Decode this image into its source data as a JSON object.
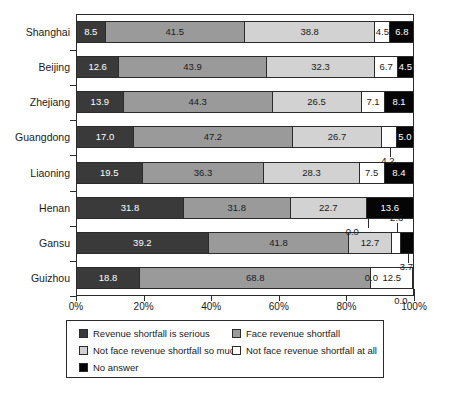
{
  "chart_data": {
    "type": "bar",
    "orientation": "horizontal",
    "stacked": true,
    "title": "",
    "subtitle": "",
    "xlabel": "",
    "ylabel": "",
    "xlim": [
      0,
      100
    ],
    "xticks": [
      "0%",
      "20%",
      "40%",
      "60%",
      "80%",
      "100%"
    ],
    "xtick_values": [
      0,
      20,
      40,
      60,
      80,
      100
    ],
    "grid": false,
    "legend_position": "bottom",
    "categories": [
      "Shanghai",
      "Beijing",
      "Zhejiang",
      "Guangdong",
      "Liaoning",
      "Henan",
      "Gansu",
      "Guizhou"
    ],
    "series": [
      {
        "name": "Revenue shortfall is serious",
        "color": "#3a3a3a",
        "values": [
          8.5,
          12.6,
          13.9,
          17.0,
          19.5,
          31.8,
          39.2,
          18.8
        ]
      },
      {
        "name": "Face revenue shortfall",
        "color": "#9a9a9a",
        "values": [
          41.5,
          43.9,
          44.3,
          47.2,
          36.3,
          31.8,
          41.8,
          68.8
        ]
      },
      {
        "name": "Not face revenue shortfall so much",
        "color": "#d2d2d2",
        "values": [
          38.8,
          32.3,
          26.5,
          26.7,
          28.3,
          22.7,
          12.7,
          0.0
        ]
      },
      {
        "name": "Not face revenue shortfall at all",
        "color": "#ffffff",
        "values": [
          4.5,
          6.7,
          7.1,
          4.2,
          7.5,
          0.0,
          2.6,
          12.5
        ]
      },
      {
        "name": "No answer",
        "color": "#050505",
        "values": [
          6.8,
          4.5,
          8.1,
          5.0,
          8.4,
          13.6,
          3.7,
          0.0
        ]
      }
    ]
  },
  "legend": {
    "items": [
      {
        "label": "Revenue shortfall is serious",
        "color": "#3a3a3a"
      },
      {
        "label": "Face revenue shortfall",
        "color": "#9a9a9a"
      },
      {
        "label": "Not face revenue shortfall so much",
        "color": "#d2d2d2"
      },
      {
        "label": "Not face revenue shortfall at all",
        "color": "#ffffff"
      },
      {
        "label": "No answer",
        "color": "#050505"
      }
    ]
  }
}
